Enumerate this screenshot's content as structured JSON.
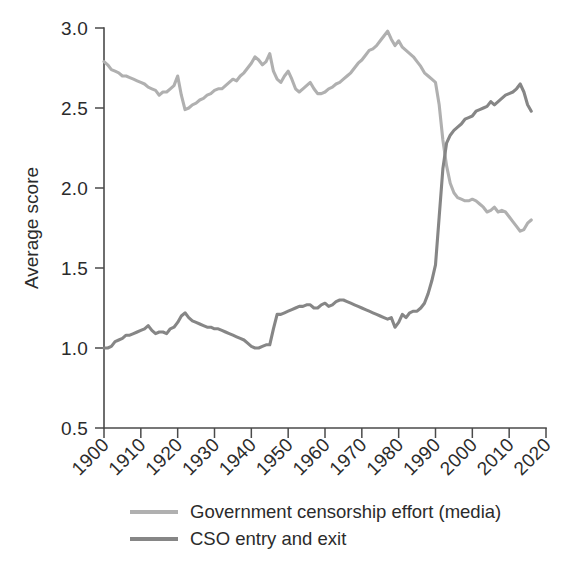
{
  "chart_data": {
    "type": "line",
    "title": "",
    "xlabel": "",
    "ylabel": "Average score",
    "xlim": [
      1900,
      2020
    ],
    "ylim": [
      0.5,
      3.0
    ],
    "grid": false,
    "legend_position": "bottom",
    "xticks": [
      "1900",
      "1910",
      "1920",
      "1930",
      "1940",
      "1950",
      "1960",
      "1970",
      "1980",
      "1990",
      "2000",
      "2010",
      "2020"
    ],
    "yticks": [
      "0.5",
      "1.0",
      "1.5",
      "2.0",
      "2.5",
      "3.0"
    ],
    "x": [
      1900,
      1901,
      1902,
      1903,
      1904,
      1905,
      1906,
      1907,
      1908,
      1909,
      1910,
      1911,
      1912,
      1913,
      1914,
      1915,
      1916,
      1917,
      1918,
      1919,
      1920,
      1921,
      1922,
      1923,
      1924,
      1925,
      1926,
      1927,
      1928,
      1929,
      1930,
      1931,
      1932,
      1933,
      1934,
      1935,
      1936,
      1937,
      1938,
      1939,
      1940,
      1941,
      1942,
      1943,
      1944,
      1945,
      1946,
      1947,
      1948,
      1949,
      1950,
      1951,
      1952,
      1953,
      1954,
      1955,
      1956,
      1957,
      1958,
      1959,
      1960,
      1961,
      1962,
      1963,
      1964,
      1965,
      1966,
      1967,
      1968,
      1969,
      1970,
      1971,
      1972,
      1973,
      1974,
      1975,
      1976,
      1977,
      1978,
      1979,
      1980,
      1981,
      1982,
      1983,
      1984,
      1985,
      1986,
      1987,
      1988,
      1989,
      1990,
      1991,
      1992,
      1993,
      1994,
      1995,
      1996,
      1997,
      1998,
      1999,
      2000,
      2001,
      2002,
      2003,
      2004,
      2005,
      2006,
      2007,
      2008,
      2009,
      2010,
      2011,
      2012,
      2013,
      2014,
      2015,
      2016
    ],
    "series": [
      {
        "name": "Government censorship effort (media)",
        "color": "#b0b0b0",
        "values": [
          2.79,
          2.77,
          2.74,
          2.73,
          2.72,
          2.7,
          2.7,
          2.69,
          2.68,
          2.67,
          2.66,
          2.65,
          2.63,
          2.62,
          2.61,
          2.58,
          2.6,
          2.6,
          2.62,
          2.64,
          2.7,
          2.58,
          2.49,
          2.5,
          2.52,
          2.53,
          2.55,
          2.56,
          2.58,
          2.59,
          2.61,
          2.62,
          2.62,
          2.64,
          2.66,
          2.68,
          2.67,
          2.7,
          2.72,
          2.75,
          2.78,
          2.82,
          2.8,
          2.77,
          2.79,
          2.84,
          2.73,
          2.68,
          2.66,
          2.7,
          2.73,
          2.68,
          2.62,
          2.6,
          2.62,
          2.64,
          2.66,
          2.62,
          2.59,
          2.59,
          2.6,
          2.62,
          2.63,
          2.65,
          2.66,
          2.68,
          2.7,
          2.72,
          2.75,
          2.78,
          2.8,
          2.83,
          2.86,
          2.87,
          2.89,
          2.92,
          2.95,
          2.98,
          2.93,
          2.89,
          2.92,
          2.88,
          2.86,
          2.84,
          2.82,
          2.79,
          2.76,
          2.72,
          2.7,
          2.68,
          2.66,
          2.52,
          2.3,
          2.14,
          2.03,
          1.97,
          1.94,
          1.93,
          1.92,
          1.92,
          1.93,
          1.92,
          1.9,
          1.88,
          1.85,
          1.86,
          1.88,
          1.85,
          1.86,
          1.85,
          1.82,
          1.79,
          1.76,
          1.73,
          1.74,
          1.78,
          1.8
        ]
      },
      {
        "name": "CSO entry and exit",
        "color": "#868686",
        "values": [
          1.0,
          1.0,
          1.01,
          1.04,
          1.05,
          1.06,
          1.08,
          1.08,
          1.09,
          1.1,
          1.11,
          1.12,
          1.14,
          1.11,
          1.09,
          1.1,
          1.1,
          1.09,
          1.12,
          1.13,
          1.16,
          1.2,
          1.22,
          1.19,
          1.17,
          1.16,
          1.15,
          1.14,
          1.13,
          1.13,
          1.12,
          1.12,
          1.11,
          1.1,
          1.09,
          1.08,
          1.07,
          1.06,
          1.05,
          1.03,
          1.01,
          1.0,
          1.0,
          1.01,
          1.02,
          1.02,
          1.12,
          1.21,
          1.21,
          1.22,
          1.23,
          1.24,
          1.25,
          1.26,
          1.26,
          1.27,
          1.27,
          1.25,
          1.25,
          1.27,
          1.28,
          1.26,
          1.27,
          1.29,
          1.3,
          1.3,
          1.29,
          1.28,
          1.27,
          1.26,
          1.25,
          1.24,
          1.23,
          1.22,
          1.21,
          1.2,
          1.19,
          1.18,
          1.19,
          1.13,
          1.16,
          1.21,
          1.19,
          1.22,
          1.23,
          1.23,
          1.25,
          1.28,
          1.34,
          1.42,
          1.52,
          1.82,
          2.12,
          2.28,
          2.33,
          2.36,
          2.38,
          2.4,
          2.43,
          2.44,
          2.45,
          2.48,
          2.49,
          2.5,
          2.51,
          2.54,
          2.52,
          2.54,
          2.56,
          2.58,
          2.59,
          2.6,
          2.62,
          2.65,
          2.6,
          2.52,
          2.48
        ]
      }
    ]
  },
  "legend": {
    "items": [
      {
        "label": "Government censorship effort (media)",
        "color": "#b0b0b0"
      },
      {
        "label": "CSO entry and exit",
        "color": "#868686"
      }
    ]
  },
  "axes": {
    "y_title": "Average score"
  }
}
